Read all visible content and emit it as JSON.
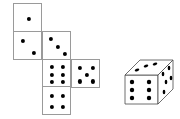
{
  "figure": {
    "background_color": "#ffffff",
    "outline_color": "#9a9a9a",
    "pip_color": "#000000",
    "width": 180,
    "height": 119
  },
  "net": {
    "label": "unfolded-cube-net",
    "face_size": 29,
    "faces": [
      {
        "name": "net-face-top",
        "value": 1,
        "x": 13,
        "y": 3,
        "pips": [
          [
            0.5,
            0.5
          ]
        ]
      },
      {
        "name": "net-face-upper-left",
        "value": 2,
        "x": 13,
        "y": 31,
        "pips": [
          [
            0.3,
            0.3
          ],
          [
            0.68,
            0.72
          ]
        ]
      },
      {
        "name": "net-face-upper-middle",
        "value": 3,
        "x": 42,
        "y": 31,
        "pips": [
          [
            0.26,
            0.24
          ],
          [
            0.5,
            0.5
          ],
          [
            0.76,
            0.76
          ]
        ]
      },
      {
        "name": "net-face-center",
        "value": 6,
        "x": 42,
        "y": 59,
        "pips": [
          [
            0.3,
            0.24
          ],
          [
            0.7,
            0.24
          ],
          [
            0.3,
            0.5
          ],
          [
            0.7,
            0.5
          ],
          [
            0.3,
            0.76
          ],
          [
            0.7,
            0.76
          ]
        ]
      },
      {
        "name": "net-face-right",
        "value": 5,
        "x": 71,
        "y": 59,
        "pips": [
          [
            0.28,
            0.26
          ],
          [
            0.72,
            0.26
          ],
          [
            0.5,
            0.5
          ],
          [
            0.28,
            0.74
          ],
          [
            0.72,
            0.74
          ]
        ]
      },
      {
        "name": "net-face-bottom",
        "value": 4,
        "x": 42,
        "y": 86,
        "pips": [
          [
            0.3,
            0.3
          ],
          [
            0.7,
            0.3
          ],
          [
            0.3,
            0.7
          ],
          [
            0.7,
            0.7
          ]
        ]
      }
    ]
  },
  "die3d": {
    "label": "three-dimensional-die",
    "origin_x": 118,
    "origin_y": 50,
    "front_face": {
      "name": "die3d-front-face",
      "value": 6,
      "polygon": "7,25 40,25 40,54 7,54",
      "pips": [
        [
          14,
          32
        ],
        [
          31,
          32
        ],
        [
          14,
          40
        ],
        [
          31,
          40
        ],
        [
          14,
          48
        ],
        [
          31,
          48
        ]
      ]
    },
    "top_face": {
      "name": "die3d-top-face",
      "value": 3,
      "polygon": "7,25 22,10 55,10 40,25",
      "pips": [
        [
          19,
          20
        ],
        [
          28,
          16
        ],
        [
          37,
          14
        ]
      ]
    },
    "right_face": {
      "name": "die3d-right-face",
      "value": 5,
      "polygon": "40,25 55,10 55,39 40,54",
      "pips": [
        [
          45,
          24
        ],
        [
          51,
          18
        ],
        [
          48,
          32
        ],
        [
          53,
          28
        ],
        [
          46,
          42
        ]
      ]
    }
  }
}
